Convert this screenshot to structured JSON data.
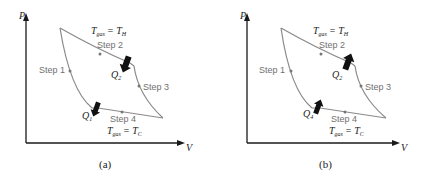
{
  "panels": [
    {
      "id": "a",
      "caption": "(a)",
      "axis_y": "P",
      "axis_x": "V",
      "top_label": "T_gas = T_H",
      "top_label_main": "T",
      "top_label_sub": "gas",
      "top_label_rhs": "= T",
      "top_label_rhs_sub": "H",
      "bottom_label_main": "T",
      "bottom_label_sub": "gas",
      "bottom_label_rhs": "= T",
      "bottom_label_rhs_sub": "C",
      "steps": [
        "Step 1",
        "Step 2",
        "Step 3",
        "Step 4"
      ],
      "q_top": "Q",
      "q_top_sub": "2",
      "q_bottom": "Q",
      "q_bottom_sub": "1",
      "heat_arrow_direction": "down"
    },
    {
      "id": "b",
      "caption": "(b)",
      "axis_y": "P",
      "axis_x": "V",
      "top_label_main": "T",
      "top_label_sub": "gas",
      "top_label_rhs": "= T",
      "top_label_rhs_sub": "H",
      "bottom_label_main": "T",
      "bottom_label_sub": "gas",
      "bottom_label_rhs": "= T",
      "bottom_label_rhs_sub": "C",
      "steps": [
        "Step 1",
        "Step 2",
        "Step 3",
        "Step 4"
      ],
      "q_top": "Q",
      "q_top_sub": "2",
      "q_bottom": "Q",
      "q_bottom_sub": "4",
      "heat_arrow_direction": "up"
    }
  ]
}
